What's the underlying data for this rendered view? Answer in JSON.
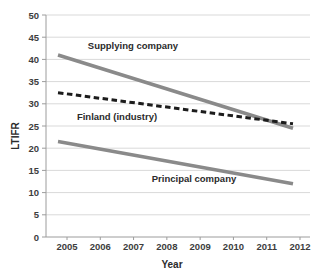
{
  "chart_data": {
    "type": "line",
    "title": "",
    "xlabel": "Year",
    "ylabel": "LTIFR",
    "x_ticks": [
      2005,
      2006,
      2007,
      2008,
      2009,
      2010,
      2011,
      2012
    ],
    "ylim": [
      0,
      50
    ],
    "ytick_step": 5,
    "grid": "horizontal",
    "legend": "inline-labels",
    "series": [
      {
        "name": "Supplying company",
        "style": "solid",
        "color": "#8a8a8a",
        "points": [
          {
            "x": 2005,
            "y": 41
          },
          {
            "x": 2012,
            "y": 24.5
          }
        ]
      },
      {
        "name": "Finland (industry)",
        "style": "dashed",
        "color": "#1c1c1c",
        "points": [
          {
            "x": 2005,
            "y": 32.5
          },
          {
            "x": 2012,
            "y": 25.5
          }
        ]
      },
      {
        "name": "Principal company",
        "style": "solid",
        "color": "#8a8a8a",
        "points": [
          {
            "x": 2005,
            "y": 21.5
          },
          {
            "x": 2012,
            "y": 12
          }
        ]
      }
    ],
    "colors": {
      "gridline": "#d9d9d9",
      "axis": "#9c9c9c",
      "tick_text": "#3d3d3d",
      "label_text": "#2b2b2b"
    }
  }
}
